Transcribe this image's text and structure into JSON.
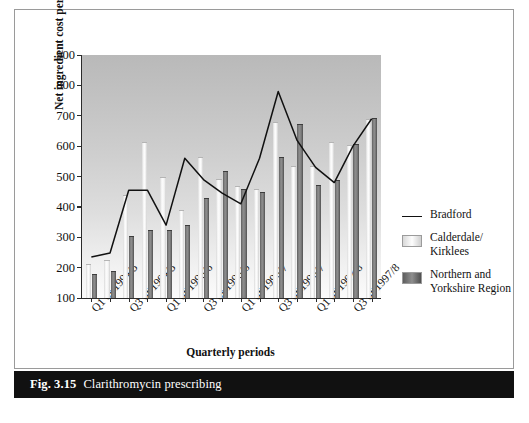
{
  "figure": {
    "caption_number": "Fig. 3.15",
    "caption_text": "Clarithromycin prescribing"
  },
  "chart_data": {
    "type": "bar",
    "title": "Clarithromycin prescribing",
    "xlabel": "Quarterly periods",
    "ylabel": "Net ingredient cost per 10,000 patients",
    "ylim": [
      100,
      900
    ],
    "yticks": [
      100,
      200,
      300,
      400,
      500,
      600,
      700,
      800,
      900
    ],
    "grid": false,
    "legend_position": "right",
    "x": [
      "Q1 of 1994/5",
      "Q2 of 1994/5",
      "Q3 of 1994/5",
      "Q4 of 1994/5",
      "Q1 of 1995/6",
      "Q2 of 1995/6",
      "Q3 of 1995/6",
      "Q4 of 1995/6",
      "Q1 of 1996/7",
      "Q2 of 1996/7",
      "Q3 of 1996/7",
      "Q4 of 1996/7",
      "Q1 of 1997/8",
      "Q2 of 1997/8",
      "Q3 of 1997/8",
      "Q4 of 1997/8"
    ],
    "tick_labels": [
      "Q1 of 1994/5",
      "",
      "Q3 of 1994/5",
      "",
      "Q1 of 1995/6",
      "",
      "Q3 of 1995/6",
      "",
      "Q1 of 1996/7",
      "",
      "Q3 of 1996/7",
      "",
      "Q1 of 1997/8",
      "",
      "Q3 of 1997/8",
      ""
    ],
    "series": [
      {
        "name": "Bradford",
        "style": "line",
        "color": "#111111",
        "values": [
          235,
          248,
          455,
          455,
          340,
          560,
          490,
          445,
          410,
          560,
          780,
          620,
          530,
          480,
          600,
          690
        ]
      },
      {
        "name": "Calderdale/Kirklees",
        "style": "bar-light",
        "color": "#f0f0f0",
        "values": [
          208,
          222,
          435,
          610,
          495,
          385,
          560,
          490,
          465,
          455,
          675,
          530,
          530,
          610,
          600,
          685
        ]
      },
      {
        "name": "Northern and Yorkshire Region",
        "style": "bar-dark",
        "color": "#7b7b7b",
        "values": [
          175,
          185,
          302,
          322,
          322,
          337,
          425,
          515,
          455,
          445,
          560,
          670,
          470,
          485,
          605,
          690
        ]
      }
    ]
  },
  "legend": {
    "items": [
      {
        "label": "Bradford",
        "key": "line"
      },
      {
        "label": "Calderdale/\nKirklees",
        "key": "swatch-light"
      },
      {
        "label": "Northern and\nYorkshire Region",
        "key": "swatch-dark"
      }
    ]
  }
}
